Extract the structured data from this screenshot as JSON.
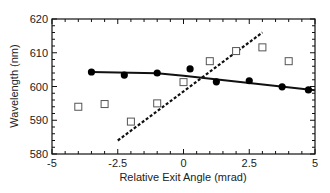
{
  "chart_data": {
    "type": "scatter",
    "title": "",
    "xlabel": "Relative Exit Angle (mrad)",
    "ylabel": "Wavelength (nm)",
    "xlim": [
      -5,
      5
    ],
    "ylim": [
      580,
      620
    ],
    "xticks": [
      "-5",
      "-2.5",
      "0",
      "2.5",
      "5"
    ],
    "yticks": [
      "580",
      "590",
      "600",
      "610",
      "620"
    ],
    "grid": false,
    "legend": null,
    "series": [
      {
        "name": "filled circles",
        "marker": "filled-circle",
        "x": [
          -3.5,
          -2.25,
          -1.0,
          0.25,
          1.25,
          2.5,
          3.75,
          4.75
        ],
        "y": [
          604.3,
          603.4,
          604.0,
          605.2,
          601.4,
          601.7,
          599.9,
          599.0
        ]
      },
      {
        "name": "open squares",
        "marker": "open-square",
        "x": [
          -4,
          -3,
          -2,
          -1,
          0,
          1,
          2,
          3,
          4
        ],
        "y": [
          594.0,
          594.8,
          589.6,
          595.0,
          601.3,
          607.5,
          610.5,
          611.6,
          607.5
        ]
      },
      {
        "name": "solid fit",
        "style": "solid-line",
        "x": [
          -3.5,
          -1.0,
          0.0,
          5.0
        ],
        "y": [
          604.3,
          603.9,
          603.2,
          598.9
        ]
      },
      {
        "name": "dashed fit",
        "style": "dashed-line",
        "x": [
          -2.5,
          3.0
        ],
        "y": [
          584.0,
          616.0
        ]
      }
    ]
  }
}
